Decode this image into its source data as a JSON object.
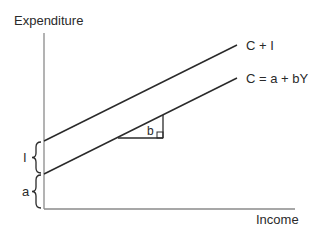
{
  "diagram": {
    "type": "keynesian-cross",
    "y_axis_label": "Expenditure",
    "x_axis_label": "Income",
    "lines": [
      {
        "id": "aggregate-expenditure",
        "label": "C + I"
      },
      {
        "id": "consumption-function",
        "label": "C = a + bY"
      }
    ],
    "slope_label": "b",
    "braces": [
      {
        "id": "investment",
        "label": "I"
      },
      {
        "id": "autonomous-consumption",
        "label": "a"
      }
    ],
    "colors": {
      "axis": "#8a8a8a",
      "line": "#2a2a2a",
      "text": "#2a2a2a"
    }
  }
}
